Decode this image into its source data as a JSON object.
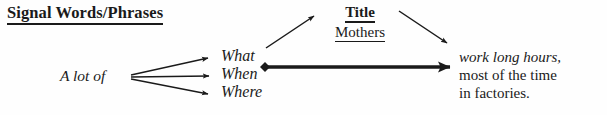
{
  "diagram": {
    "type": "sentence-structure-diagram",
    "background_color": "#fefefe",
    "ink_color": "#1a1a1a",
    "heading": "Signal Words/Phrases",
    "title_label": "Title",
    "title_value": "Mothers",
    "subject": "A lot of",
    "signal_words": [
      "What",
      "When",
      "Where"
    ],
    "predicate_lines": [
      "work long hours,",
      "most of the time",
      "in factories."
    ],
    "connectors": [
      {
        "name": "subject-to-what",
        "from": "A lot of",
        "to": "What",
        "style": "thin-arrow"
      },
      {
        "name": "subject-to-when",
        "from": "A lot of",
        "to": "When",
        "style": "thin-arrow"
      },
      {
        "name": "subject-to-where",
        "from": "A lot of",
        "to": "Where",
        "style": "thin-arrow"
      },
      {
        "name": "what-to-title",
        "from": "What",
        "to": "Title",
        "style": "thin-arrow-diagonal-up"
      },
      {
        "name": "title-to-predicate",
        "from": "Title",
        "to": "work long hours,",
        "style": "thin-arrow-diagonal-down"
      },
      {
        "name": "signal-to-predicate",
        "from": "What",
        "to": "work long hours,",
        "style": "thick-arrow-with-diamond-tail"
      }
    ]
  }
}
